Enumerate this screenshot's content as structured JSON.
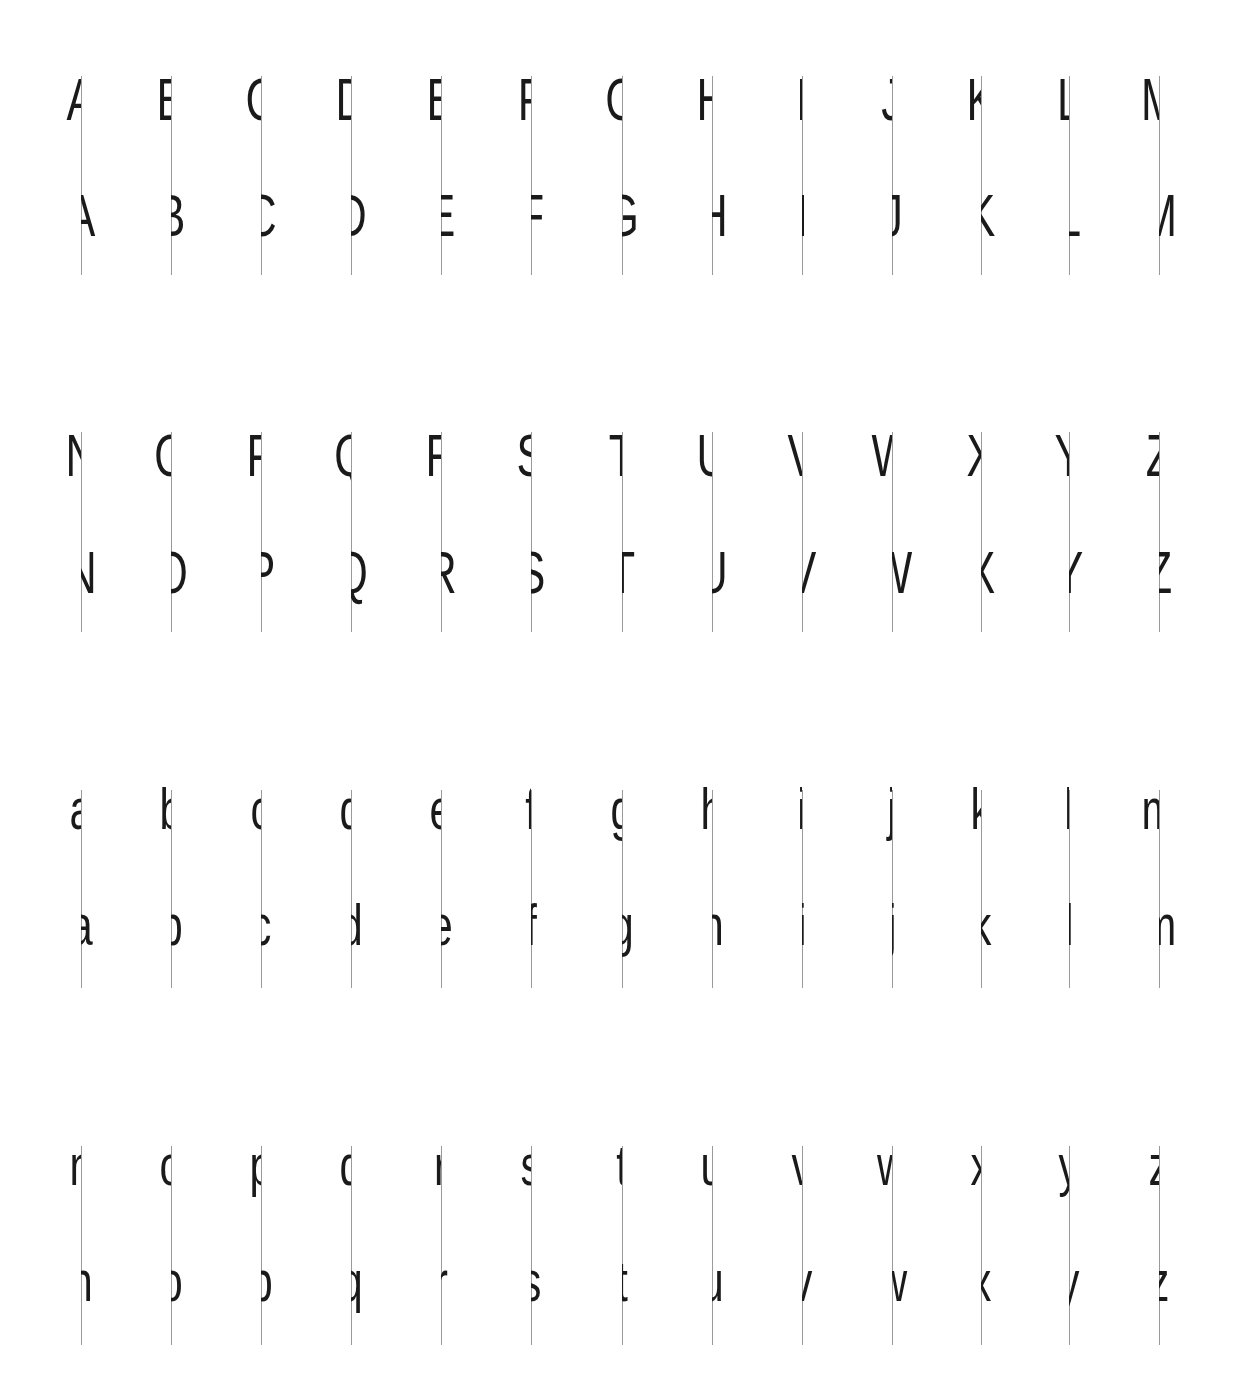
{
  "specimen": {
    "description": "Split-letter specimen: each glyph bisected by a vertical guide; upper row shows left half, lower row shows right half",
    "line_color": "#9a9a9a",
    "ink_color": "#1a1a1a",
    "columns_x": [
      81,
      171,
      261,
      351,
      441,
      531,
      622,
      712,
      802,
      892,
      981,
      1069,
      1159
    ],
    "blocks": [
      {
        "case": "upper",
        "letters": [
          "A",
          "B",
          "C",
          "D",
          "E",
          "F",
          "G",
          "H",
          "I",
          "J",
          "K",
          "L",
          "M"
        ]
      },
      {
        "case": "upper",
        "letters": [
          "N",
          "O",
          "P",
          "Q",
          "R",
          "S",
          "T",
          "U",
          "V",
          "W",
          "X",
          "Y",
          "Z"
        ]
      },
      {
        "case": "lower",
        "letters": [
          "a",
          "b",
          "c",
          "d",
          "e",
          "f",
          "g",
          "h",
          "i",
          "j",
          "k",
          "l",
          "m"
        ]
      },
      {
        "case": "lower",
        "letters": [
          "n",
          "o",
          "p",
          "q",
          "r",
          "s",
          "t",
          "u",
          "v",
          "w",
          "x",
          "y",
          "z"
        ]
      }
    ]
  }
}
